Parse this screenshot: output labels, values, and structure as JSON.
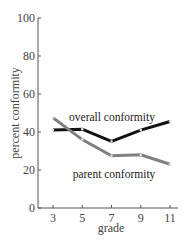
{
  "chart_data": {
    "type": "line",
    "title": "",
    "xlabel": "grade",
    "ylabel": "percent conformity",
    "x": [
      3,
      5,
      7,
      9,
      11
    ],
    "xticks": [
      "3",
      "5",
      "7",
      "9",
      "11"
    ],
    "yticks": [
      "0",
      "20",
      "40",
      "60",
      "80",
      "100"
    ],
    "ylim": [
      0,
      100
    ],
    "grid": false,
    "legend": "inline labels",
    "series": [
      {
        "name": "overall conformity",
        "values": [
          41,
          41.5,
          35,
          41,
          45.5
        ],
        "color": "#111111"
      },
      {
        "name": "parent conformity",
        "values": [
          47.5,
          36,
          27.5,
          28,
          23
        ],
        "color": "#808080"
      }
    ]
  }
}
